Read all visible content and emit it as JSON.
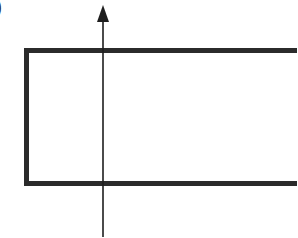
{
  "figure": {
    "panel_label_fragment": ")",
    "colors": {
      "background": "#ffffff",
      "stroke": "#1e1e1e",
      "rect_stroke": "#2b2b2b"
    },
    "shapes": {
      "rectangle": {
        "x": 26.5,
        "y": 50.5,
        "width": 290,
        "height": 133,
        "stroke_width": 5,
        "note": "extends past right edge of crop"
      },
      "arrow": {
        "x": 103,
        "y_start": 237,
        "y_end": 5,
        "stroke_width": 1.6,
        "direction": "up"
      }
    }
  }
}
